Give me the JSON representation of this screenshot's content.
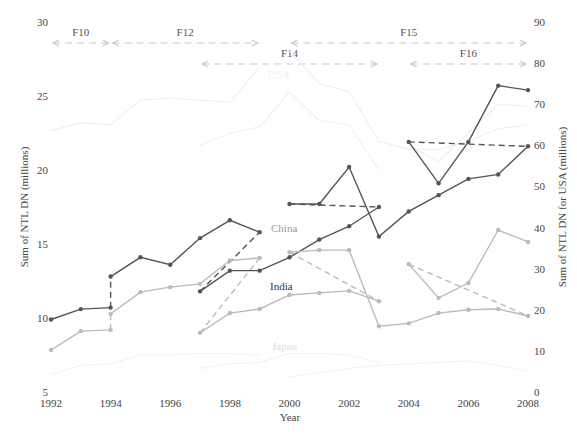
{
  "chart_data": {
    "type": "line",
    "title": "",
    "xlabel": "Year",
    "ylabel": "Sum of NTL DN (millions)",
    "ylabel_right": "Sum of NTL DN for USA (millions)",
    "x_ticks": [
      "1992",
      "1994",
      "1996",
      "1998",
      "2000",
      "2002",
      "2004",
      "2006",
      "2008"
    ],
    "xlim": [
      1992,
      2008
    ],
    "y_left_ticks": [
      "5",
      "10",
      "15",
      "20",
      "25",
      "30"
    ],
    "ylim_left": [
      5,
      30
    ],
    "y_right_ticks": [
      "0",
      "10",
      "20",
      "30",
      "40",
      "50",
      "60",
      "70",
      "80",
      "90"
    ],
    "ylim_right": [
      0,
      90
    ],
    "grid": false,
    "satellite_spans": [
      {
        "name": "F10",
        "start": 1992,
        "end": 1994,
        "row": 1
      },
      {
        "name": "F12",
        "start": 1994,
        "end": 1999,
        "row": 1
      },
      {
        "name": "F14",
        "start": 1997,
        "end": 2003,
        "row": 2
      },
      {
        "name": "F15",
        "start": 2000,
        "end": 2008,
        "row": 1
      },
      {
        "name": "F16",
        "start": 2004,
        "end": 2008,
        "row": 2
      }
    ],
    "series_labels": [
      {
        "text": "China",
        "color": "#9a9a9a"
      },
      {
        "text": "India",
        "color": "#333333"
      },
      {
        "text": "USA",
        "color": "#eeeeee"
      },
      {
        "text": "Japan",
        "color": "#dddddd"
      }
    ],
    "series": [
      {
        "name": "China F10",
        "axis": "left",
        "color": "#555555",
        "x": [
          1992,
          1993,
          1994
        ],
        "values": [
          9.9,
          10.6,
          10.7
        ]
      },
      {
        "name": "China F12",
        "axis": "left",
        "color": "#555555",
        "x": [
          1994,
          1995,
          1996,
          1997,
          1998,
          1999
        ],
        "values": [
          12.8,
          14.1,
          13.6,
          15.4,
          16.6,
          15.8
        ]
      },
      {
        "name": "China F14",
        "axis": "left",
        "color": "#555555",
        "x": [
          1997,
          1998,
          1999,
          2000,
          2001,
          2002,
          2003
        ],
        "values": [
          11.8,
          13.2,
          13.2,
          14.1,
          15.3,
          16.2,
          17.5
        ]
      },
      {
        "name": "China F15",
        "axis": "left",
        "color": "#555555",
        "x": [
          2000,
          2001,
          2002,
          2003,
          2004,
          2005,
          2006,
          2007,
          2008
        ],
        "values": [
          17.7,
          17.7,
          20.2,
          15.5,
          17.2,
          18.3,
          19.4,
          19.7,
          21.6
        ]
      },
      {
        "name": "China F16",
        "axis": "left",
        "color": "#555555",
        "x": [
          2004,
          2005,
          2006,
          2007,
          2008
        ],
        "values": [
          21.9,
          19.1,
          21.9,
          25.7,
          25.4
        ]
      },
      {
        "name": "India F10",
        "axis": "right",
        "color": "#bbbbbb",
        "x": [
          1992,
          1993,
          1994
        ],
        "values": [
          10.2,
          14.8,
          15.1
        ]
      },
      {
        "name": "India F12",
        "axis": "right",
        "color": "#bbbbbb",
        "x": [
          1994,
          1995,
          1996,
          1997,
          1998,
          1999
        ],
        "values": [
          19.0,
          24.3,
          25.5,
          26.3,
          32.0,
          32.6
        ]
      },
      {
        "name": "India F14",
        "axis": "right",
        "color": "#bbbbbb",
        "x": [
          1997,
          1998,
          1999,
          2000,
          2001,
          2002,
          2003
        ],
        "values": [
          14.4,
          19.2,
          20.2,
          23.6,
          24.1,
          24.6,
          22.1
        ]
      },
      {
        "name": "India F15",
        "axis": "right",
        "color": "#bbbbbb",
        "x": [
          2000,
          2001,
          2002,
          2003,
          2004,
          2005,
          2006,
          2007,
          2008
        ],
        "values": [
          34.0,
          34.5,
          34.5,
          16.0,
          16.7,
          19.2,
          20.0,
          20.2,
          18.5
        ]
      },
      {
        "name": "India F16",
        "axis": "right",
        "color": "#bbbbbb",
        "x": [
          2004,
          2005,
          2006,
          2007,
          2008
        ],
        "values": [
          31.1,
          22.9,
          26.5,
          39.4,
          36.5
        ]
      },
      {
        "name": "USA F10-F12",
        "axis": "right",
        "color": "#f0f0f0",
        "x": [
          1992,
          1993,
          1994,
          1995,
          1996,
          1997,
          1998,
          1999
        ],
        "values": [
          63.5,
          65.5,
          65.0,
          71.0,
          71.5,
          71.0,
          70.5,
          79.0
        ]
      },
      {
        "name": "USA F14",
        "axis": "right",
        "color": "#f0f0f0",
        "x": [
          1997,
          1998,
          1999,
          2000,
          2001,
          2002,
          2003
        ],
        "values": [
          60.0,
          63.0,
          64.5,
          73.0,
          66.0,
          65.0,
          54.0
        ]
      },
      {
        "name": "USA F15",
        "axis": "right",
        "color": "#f0f0f0",
        "x": [
          2000,
          2001,
          2002,
          2003,
          2004,
          2005,
          2006,
          2007,
          2008
        ],
        "values": [
          83.0,
          75.0,
          73.0,
          61.0,
          59.0,
          59.0,
          61.0,
          64.0,
          65.0
        ]
      },
      {
        "name": "USA F16",
        "axis": "right",
        "color": "#f0f0f0",
        "x": [
          2004,
          2005,
          2006,
          2007,
          2008
        ],
        "values": [
          60.0,
          56.0,
          63.0,
          70.0,
          69.5
        ]
      },
      {
        "name": "Japan F10-F12",
        "axis": "left",
        "color": "#f2f2f2",
        "x": [
          1992,
          1993,
          1994,
          1995,
          1996,
          1997,
          1998,
          1999
        ],
        "values": [
          6.2,
          6.8,
          6.9,
          7.5,
          7.5,
          7.6,
          7.6,
          7.5
        ]
      },
      {
        "name": "Japan F14",
        "axis": "left",
        "color": "#f2f2f2",
        "x": [
          1997,
          1998,
          1999,
          2000,
          2001,
          2002,
          2003
        ],
        "values": [
          6.6,
          6.9,
          7.0,
          7.6,
          7.6,
          7.5,
          7.0
        ]
      },
      {
        "name": "Japan F15-F16",
        "axis": "left",
        "color": "#f2f2f2",
        "x": [
          2000,
          2001,
          2002,
          2003,
          2004,
          2005,
          2006,
          2007,
          2008
        ],
        "values": [
          6.0,
          6.3,
          6.6,
          6.8,
          6.9,
          7.0,
          7.1,
          6.8,
          6.4
        ]
      }
    ],
    "overlap_connectors": [
      {
        "axis": "left",
        "color": "#555555",
        "from": [
          1994,
          10.7
        ],
        "to": [
          1994,
          12.8
        ]
      },
      {
        "axis": "left",
        "color": "#555555",
        "from": [
          1997,
          11.8
        ],
        "to": [
          1999,
          15.8
        ]
      },
      {
        "axis": "left",
        "color": "#555555",
        "from": [
          2000,
          17.7
        ],
        "to": [
          2003,
          17.5
        ]
      },
      {
        "axis": "left",
        "color": "#555555",
        "from": [
          2004,
          21.9
        ],
        "to": [
          2008,
          21.6
        ]
      },
      {
        "axis": "right",
        "color": "#bbbbbb",
        "from": [
          1994,
          15.1
        ],
        "to": [
          1994,
          19.0
        ]
      },
      {
        "axis": "right",
        "color": "#bbbbbb",
        "from": [
          1997,
          14.4
        ],
        "to": [
          1999,
          32.6
        ]
      },
      {
        "axis": "right",
        "color": "#bbbbbb",
        "from": [
          2000,
          34.0
        ],
        "to": [
          2003,
          22.1
        ]
      },
      {
        "axis": "right",
        "color": "#bbbbbb",
        "from": [
          2004,
          31.1
        ],
        "to": [
          2008,
          18.5
        ]
      }
    ]
  }
}
